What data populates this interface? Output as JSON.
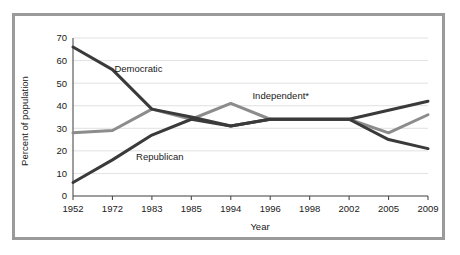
{
  "figure": {
    "border_color": "#9a9a9a",
    "background": "#ffffff"
  },
  "chart_data": {
    "type": "line",
    "title": "",
    "xlabel": "Year",
    "ylabel": "Percent of population",
    "categories": [
      "1952",
      "1972",
      "1983",
      "1985",
      "1994",
      "1996",
      "1998",
      "2002",
      "2005",
      "2009"
    ],
    "ylim": [
      0,
      70
    ],
    "yticks": [
      0,
      10,
      20,
      30,
      40,
      50,
      60,
      70
    ],
    "ytick_labels": [
      "0",
      "10",
      "20",
      "30",
      "40",
      "50",
      "60",
      "70"
    ],
    "grid": true,
    "legend": "inline-labels",
    "series": [
      {
        "name": "Democratic",
        "label": "Democratic",
        "color": "#3a3a3a",
        "values": [
          66,
          56,
          38.5,
          35,
          31,
          34,
          34,
          34,
          38,
          42
        ]
      },
      {
        "name": "Republican",
        "label": "Republican",
        "color": "#3a3a3a",
        "values": [
          6,
          16,
          27,
          34,
          31,
          34,
          34,
          34,
          25,
          21
        ]
      },
      {
        "name": "Independent",
        "label": "Independent*",
        "color": "#8c8c8c",
        "values": [
          28,
          29,
          38.5,
          34,
          41,
          34,
          34,
          34,
          28,
          36
        ]
      }
    ],
    "annotations": [
      {
        "text": "Democratic",
        "x": 1.05,
        "y": 55
      },
      {
        "text": "Republican",
        "x": 1.6,
        "y": 16
      },
      {
        "text": "Independent*",
        "x": 4.55,
        "y": 43
      }
    ]
  }
}
